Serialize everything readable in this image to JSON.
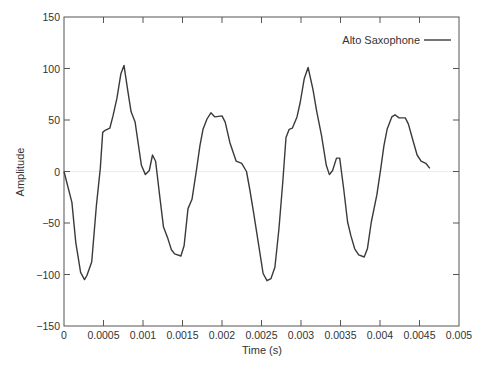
{
  "chart_data": {
    "type": "line",
    "title": "",
    "xlabel": "Time (s)",
    "ylabel": "Amplitude",
    "xlim": [
      0,
      0.005
    ],
    "ylim": [
      -150,
      150
    ],
    "grid": false,
    "zero_line": true,
    "legend_position": "upper right",
    "x_ticks": [
      0,
      0.0005,
      0.001,
      0.0015,
      0.002,
      0.0025,
      0.003,
      0.0035,
      0.004,
      0.0045,
      0.005
    ],
    "x_tick_labels": [
      "0",
      "0.0005",
      "0.001",
      "0.0015",
      "0.002",
      "0.0025",
      "0.003",
      "0.0035",
      "0.004",
      "0.0045",
      "0.005"
    ],
    "y_ticks": [
      -150,
      -100,
      -50,
      0,
      50,
      100,
      150
    ],
    "y_tick_labels": [
      "−150",
      "−100",
      "−50",
      "0",
      "50",
      "100",
      "150"
    ],
    "series": [
      {
        "name": "Alto Saxophone",
        "color": "#3a3a3a",
        "x": [
          0,
          0.0001,
          0.00015,
          0.00021,
          0.00026,
          0.00029,
          0.00035,
          0.00041,
          0.00046,
          0.00049,
          0.00052,
          0.00058,
          0.00062,
          0.00067,
          0.00072,
          0.00076,
          0.00081,
          0.00085,
          0.0009,
          0.00098,
          0.00103,
          0.00108,
          0.00112,
          0.00116,
          0.00121,
          0.00126,
          0.00131,
          0.00136,
          0.0014,
          0.00148,
          0.00152,
          0.00157,
          0.00162,
          0.00168,
          0.00172,
          0.00176,
          0.00181,
          0.00186,
          0.00191,
          0.002,
          0.00204,
          0.0021,
          0.00218,
          0.00225,
          0.00231,
          0.00235,
          0.0024,
          0.00246,
          0.00252,
          0.00257,
          0.00262,
          0.00267,
          0.00272,
          0.00277,
          0.00281,
          0.00285,
          0.00289,
          0.00295,
          0.00299,
          0.00304,
          0.00309,
          0.00315,
          0.0032,
          0.00326,
          0.00332,
          0.00336,
          0.0034,
          0.00345,
          0.00349,
          0.00354,
          0.00359,
          0.00363,
          0.00368,
          0.00373,
          0.0038,
          0.00384,
          0.00389,
          0.00396,
          0.00401,
          0.00405,
          0.00409,
          0.00415,
          0.00419,
          0.00424,
          0.00432,
          0.00436,
          0.00441,
          0.00447,
          0.00452,
          0.00458,
          0.00463
        ],
        "values": [
          0,
          -30,
          -69,
          -98,
          -105,
          -101,
          -88,
          -33,
          3,
          38,
          40,
          42,
          54,
          71,
          95,
          103,
          77,
          58,
          48,
          6,
          -3,
          1,
          16,
          10,
          -23,
          -54,
          -64,
          -76,
          -80,
          -82,
          -72,
          -36,
          -27,
          3,
          25,
          41,
          51,
          57,
          53,
          54,
          48,
          28,
          10,
          8,
          0,
          -17,
          -40,
          -69,
          -99,
          -106,
          -104,
          -93,
          -56,
          -10,
          33,
          41,
          42,
          53,
          67,
          90,
          101,
          80,
          58,
          35,
          6,
          -3,
          1,
          13,
          13,
          -17,
          -49,
          -62,
          -75,
          -81,
          -83,
          -75,
          -49,
          -23,
          3,
          25,
          41,
          53,
          55,
          52,
          52,
          46,
          32,
          16,
          10,
          8,
          3
        ]
      }
    ]
  },
  "legend": {
    "label": "Alto Saxophone"
  },
  "axes": {
    "xlabel": "Time (s)",
    "ylabel": "Amplitude"
  },
  "colors": {
    "line": "#3a3a3a",
    "axis": "#555555",
    "zero_line": "#ececec",
    "text": "#333333"
  }
}
